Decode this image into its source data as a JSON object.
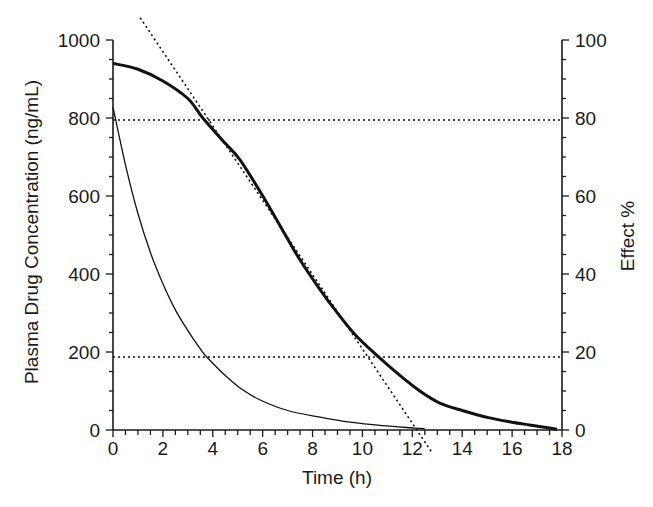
{
  "chart_data": {
    "type": "line",
    "title": "",
    "xlabel": "Time (h)",
    "ylabel": "Plasma Drug Concentration (ng/mL)",
    "y2label": "Effect %",
    "xlim": [
      0,
      18
    ],
    "ylim": [
      0,
      1000
    ],
    "y2lim": [
      0,
      100
    ],
    "x_ticks": [
      0,
      2,
      4,
      6,
      8,
      10,
      12,
      14,
      16,
      18
    ],
    "y_ticks": [
      0,
      200,
      400,
      600,
      800,
      1000
    ],
    "y2_ticks": [
      0,
      20,
      40,
      60,
      80,
      100
    ],
    "x_minor_step": 0.5,
    "y_minor_step": 50,
    "y2_minor_step": 5,
    "grid": false,
    "legend": null,
    "series": [
      {
        "name": "Effect (thick curve)",
        "style": "solid-thick",
        "x": [
          0,
          1,
          2,
          3,
          3.6,
          4.5,
          5.1,
          6.1,
          7.0,
          7.5,
          8.3,
          8.9,
          9.7,
          10.6,
          11.5,
          12.3,
          13.1,
          14.0,
          15.1,
          16.0,
          16.7,
          17.3,
          17.8
        ],
        "values": [
          940,
          925,
          895,
          850,
          800,
          735,
          692,
          590,
          490,
          436,
          360,
          308,
          245,
          190,
          140,
          100,
          69,
          50,
          31,
          20,
          13,
          7,
          2
        ]
      },
      {
        "name": "Plasma drug concentration (thin curve)",
        "style": "solid-thin",
        "x": [
          0,
          0.5,
          1,
          1.5,
          2,
          2.5,
          3,
          3.5,
          3.75,
          4.5,
          5.2,
          5.9,
          7.0,
          8.3,
          9.5,
          10.8,
          12.1,
          12.5
        ],
        "values": [
          828,
          680,
          555,
          455,
          375,
          308,
          255,
          208,
          188,
          140,
          103,
          77,
          50,
          33,
          20,
          11,
          5,
          3
        ]
      },
      {
        "name": "Tangent line (dotted)",
        "style": "dotted",
        "x": [
          1.09,
          12.8
        ],
        "values": [
          1057,
          -59
        ]
      },
      {
        "name": "80% effect threshold",
        "style": "dotted",
        "x": [
          0,
          18
        ],
        "values": [
          795,
          795
        ]
      },
      {
        "name": "20% effect threshold",
        "style": "dotted",
        "x": [
          0,
          18
        ],
        "values": [
          187,
          187
        ]
      }
    ],
    "annotations": []
  },
  "plot_area": {
    "x0_px": 113,
    "x1_px": 562,
    "y0_px": 430,
    "y1_px": 40
  },
  "colors": {
    "axis": "#1a1a1a",
    "line": "#111111",
    "background": "#ffffff"
  }
}
